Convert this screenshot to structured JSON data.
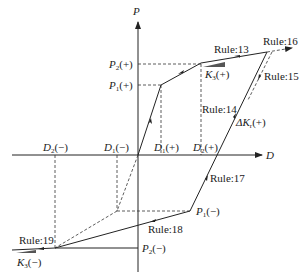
{
  "diagram": {
    "type": "hysteresis-rule-diagram",
    "axes": {
      "x_label": "D",
      "y_label": "P"
    },
    "points": {
      "p1_pos": {
        "sym": "P",
        "sub": "1",
        "sign": "(+)"
      },
      "p2_pos": {
        "sym": "P",
        "sub": "2",
        "sign": "(+)"
      },
      "p1_neg": {
        "sym": "P",
        "sub": "1",
        "sign": "(−)"
      },
      "p2_neg": {
        "sym": "P",
        "sub": "2",
        "sign": "(−)"
      },
      "d1_pos": {
        "sym": "D",
        "sub": "1",
        "sign": "(+)"
      },
      "d2_pos": {
        "sym": "D",
        "sub": "2",
        "sign": "(+)"
      },
      "d1_neg": {
        "sym": "D",
        "sub": "1",
        "sign": "(−)"
      },
      "d2_neg": {
        "sym": "D",
        "sub": "2",
        "sign": "(−)"
      },
      "k3_pos": {
        "sym": "K",
        "sub": "3",
        "sign": "(+)"
      },
      "k3_neg": {
        "sym": "K",
        "sub": "3",
        "sign": "(−)"
      },
      "dk_pos": {
        "sym": "ΔK",
        "sub": "r",
        "sign": "(+)"
      }
    },
    "rules": {
      "r13": "Rule:13",
      "r14": "Rule:14",
      "r15": "Rule:15",
      "r16": "Rule:16",
      "r17": "Rule:17",
      "r18": "Rule:18",
      "r19": "Rule:19"
    },
    "colors": {
      "line": "#222222",
      "background": "#ffffff"
    }
  }
}
